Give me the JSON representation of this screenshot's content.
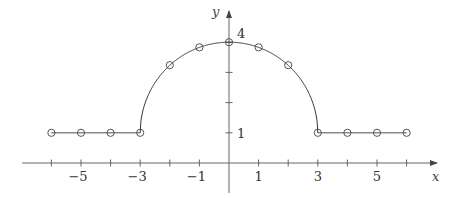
{
  "chart_data": {
    "type": "line",
    "title": "",
    "xlabel": "x",
    "ylabel": "y",
    "xlim": [
      -7,
      7
    ],
    "ylim": [
      -0.8,
      4.7
    ],
    "grid": false,
    "legend": "none",
    "x_ticks": [
      -6,
      -5,
      -4,
      -3,
      -2,
      -1,
      1,
      2,
      3,
      4,
      5,
      6
    ],
    "x_tick_labels": [
      {
        "value": -5,
        "label": "−5"
      },
      {
        "value": -3,
        "label": "−3"
      },
      {
        "value": -1,
        "label": "−1"
      },
      {
        "value": 1,
        "label": "1"
      },
      {
        "value": 3,
        "label": "3"
      },
      {
        "value": 5,
        "label": "5"
      }
    ],
    "y_ticks": [
      1,
      2,
      3,
      4
    ],
    "y_tick_labels": [
      {
        "value": 1,
        "label": "1"
      },
      {
        "value": 4,
        "label": "4"
      }
    ],
    "curve": {
      "description": "f(x) = 1 for |x| >= 3, f(x) = 1 + sqrt(9 - x^2) for |x| < 3",
      "x_range": [
        -6,
        6
      ]
    },
    "series": [
      {
        "name": "sample points",
        "marker": "open-circle",
        "x": [
          -6,
          -5,
          -4,
          -3,
          -2,
          -1,
          0,
          1,
          2,
          3,
          4,
          5,
          6
        ],
        "y": [
          1,
          1,
          1,
          1,
          3.24,
          3.83,
          4,
          3.83,
          3.24,
          1,
          1,
          1,
          1
        ]
      }
    ]
  }
}
